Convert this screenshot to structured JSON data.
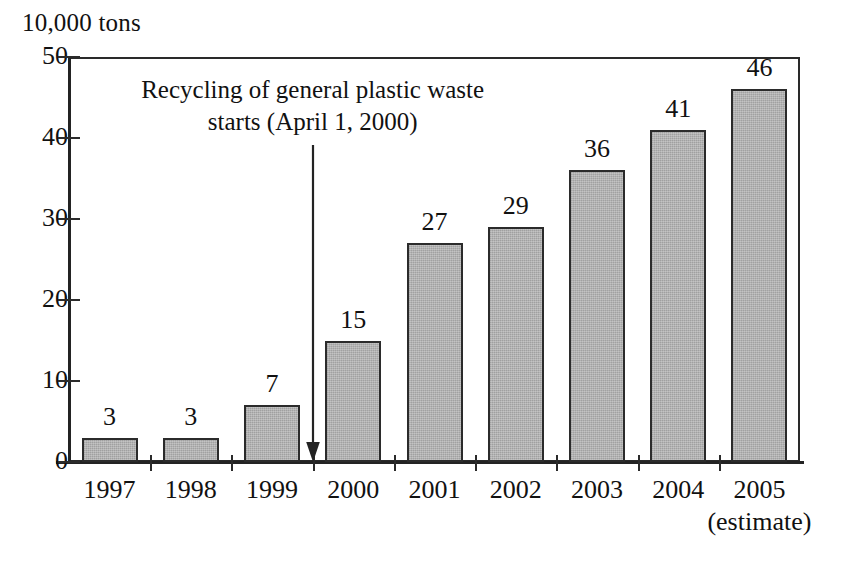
{
  "chart_data": {
    "type": "bar",
    "title": "",
    "unit_label": "10,000 tons",
    "xlabel": "",
    "ylabel": "10,000 tons",
    "ylim": [
      0,
      50
    ],
    "yticks": [
      0,
      10,
      20,
      30,
      40,
      50
    ],
    "ytick_labels": [
      "0",
      "10",
      "20",
      "30",
      "40",
      "50"
    ],
    "grid": false,
    "legend": "none",
    "categories": [
      "1997",
      "1998",
      "1999",
      "2000",
      "2001",
      "2002",
      "2003",
      "2004",
      "2005"
    ],
    "category_sublabels": [
      "",
      "",
      "",
      "",
      "",
      "",
      "",
      "",
      "(estimate)"
    ],
    "values": [
      3,
      3,
      7,
      15,
      27,
      29,
      36,
      41,
      46
    ],
    "value_labels": [
      "3",
      "3",
      "7",
      "15",
      "27",
      "29",
      "36",
      "41",
      "46"
    ],
    "bar_color": "#a9a9a9",
    "bar_border_color": "#2b2b2b",
    "axis_color": "#232323",
    "annotations": [
      {
        "name": "recycling-start",
        "line1": "Recycling of general plastic waste",
        "line2": "starts (April 1, 2000)",
        "arrow_at_category_boundary": "1999/2000"
      }
    ]
  }
}
